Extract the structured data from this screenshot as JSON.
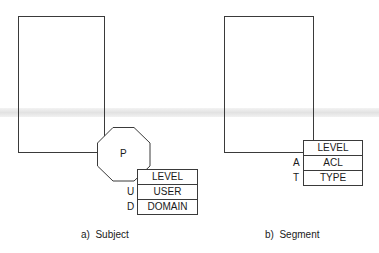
{
  "diagram": {
    "subject": {
      "process_label": "P",
      "table": [
        {
          "key": "",
          "value": "LEVEL"
        },
        {
          "key": "U",
          "value": "USER"
        },
        {
          "key": "D",
          "value": "DOMAIN"
        }
      ],
      "caption": "a)  Subject"
    },
    "segment": {
      "table": [
        {
          "key": "",
          "value": "LEVEL"
        },
        {
          "key": "A",
          "value": "ACL"
        },
        {
          "key": "T",
          "value": "TYPE"
        }
      ],
      "caption": "b)  Segment"
    }
  }
}
